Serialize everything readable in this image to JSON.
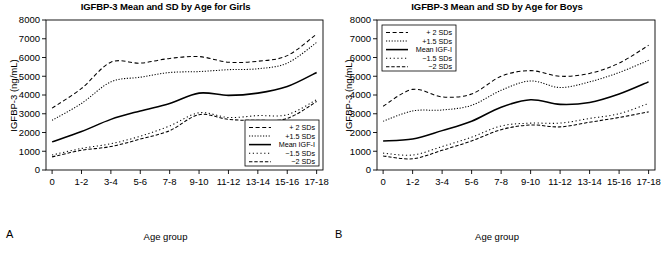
{
  "figure": {
    "panels": [
      {
        "letter": "A",
        "title": "IGFBP-3 Mean and SD by Age for Girls",
        "ylabel": "IGFBP-3 (ng/mL)",
        "xlabel": "Age group",
        "legend_position": "bottom-right"
      },
      {
        "letter": "B",
        "title": "IGFBP-3 Mean and SD by Age for Boys",
        "ylabel": "IGFBP-3 (ng/mL)",
        "xlabel": "Age group",
        "legend_position": "top-left"
      }
    ]
  },
  "chart_data": [
    {
      "type": "line",
      "title": "IGFBP-3 Mean and SD by Age for Girls",
      "panel_letter": "A",
      "xlabel": "Age group",
      "ylabel": "IGFBP-3 (ng/mL)",
      "categories": [
        "0",
        "1-2",
        "3-4",
        "5-6",
        "7-8",
        "9-10",
        "11-12",
        "13-14",
        "15-16",
        "17-18"
      ],
      "yticks": [
        0,
        1000,
        2000,
        3000,
        4000,
        5000,
        6000,
        7000,
        8000
      ],
      "ylim": [
        0,
        8000
      ],
      "grid": false,
      "legend": [
        "+ 2 SDs",
        "+1.5 SDs",
        "Mean IGF-I",
        "−1.5 SDs",
        "−2 SDs"
      ],
      "series": [
        {
          "name": "+ 2 SDs",
          "values": [
            3300,
            4350,
            5750,
            5700,
            5950,
            6050,
            5750,
            5800,
            6100,
            7250
          ]
        },
        {
          "name": "+1.5 SDs",
          "values": [
            2650,
            3550,
            4700,
            4950,
            5200,
            5250,
            5350,
            5400,
            5700,
            6800
          ]
        },
        {
          "name": "Mean IGF-I",
          "values": [
            1500,
            2050,
            2700,
            3150,
            3550,
            4100,
            3980,
            4100,
            4450,
            5200
          ]
        },
        {
          "name": "−1.5 SDs",
          "values": [
            800,
            1150,
            1400,
            1800,
            2350,
            3050,
            2800,
            2900,
            2950,
            3750
          ]
        },
        {
          "name": "−2 SDs",
          "values": [
            700,
            1050,
            1250,
            1650,
            2100,
            2950,
            2700,
            2650,
            2750,
            3650
          ]
        }
      ]
    },
    {
      "type": "line",
      "title": "IGFBP-3 Mean and SD by Age for Boys",
      "panel_letter": "B",
      "xlabel": "Age group",
      "ylabel": "IGFBP-3 (ng/mL)",
      "categories": [
        "0",
        "1-2",
        "3-4",
        "5-6",
        "7-8",
        "9-10",
        "11-12",
        "13-14",
        "15-16",
        "17-18"
      ],
      "yticks": [
        0,
        1000,
        2000,
        3000,
        4000,
        5000,
        6000,
        7000,
        8000
      ],
      "ylim": [
        0,
        8000
      ],
      "grid": false,
      "legend": [
        "+ 2 SDs",
        "+1.5 SDs",
        "Mean IGF-I",
        "−1.5 SDs",
        "−2 SDs"
      ],
      "series": [
        {
          "name": "+ 2 SDs",
          "values": [
            3400,
            4300,
            3900,
            4050,
            5000,
            5300,
            5000,
            5150,
            5700,
            6650
          ]
        },
        {
          "name": "+1.5 SDs",
          "values": [
            2600,
            3150,
            3200,
            3450,
            4250,
            4750,
            4400,
            4700,
            5200,
            5850
          ]
        },
        {
          "name": "Mean IGF-I",
          "values": [
            1550,
            1650,
            2100,
            2600,
            3350,
            3750,
            3500,
            3600,
            4050,
            4700
          ]
        },
        {
          "name": "−1.5 SDs",
          "values": [
            900,
            800,
            1250,
            1750,
            2350,
            2500,
            2500,
            2750,
            3000,
            3550
          ]
        },
        {
          "name": "−2 SDs",
          "values": [
            750,
            600,
            1050,
            1550,
            2150,
            2400,
            2300,
            2550,
            2800,
            3100
          ]
        }
      ]
    }
  ]
}
